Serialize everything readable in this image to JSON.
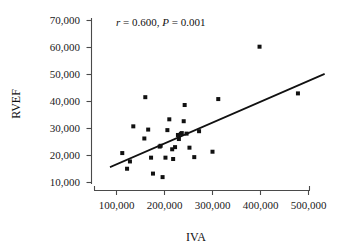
{
  "chart_data": {
    "type": "scatter",
    "title": "",
    "subtitle": "",
    "xlabel": "IVA",
    "ylabel": "RVEF",
    "xlim": [
      80000,
      530000
    ],
    "ylim": [
      8000,
      72000
    ],
    "xticks": [
      100000,
      200000,
      300000,
      400000,
      500000
    ],
    "xtick_labels": [
      "100,000",
      "200,000",
      "300,000",
      "400,000",
      "500,000"
    ],
    "yticks": [
      10000,
      20000,
      30000,
      40000,
      50000,
      60000,
      70000
    ],
    "ytick_labels": [
      "10,000",
      "20,000",
      "30,000",
      "40,000",
      "50,000",
      "60,000",
      "70,000"
    ],
    "grid": false,
    "legend": null,
    "annotations": [
      {
        "name": "correlation-statistics",
        "text": "r = 0.600, P = 0.001",
        "r_symbol": "r",
        "r_value": "= 0.600,",
        "p_symbol": "P",
        "p_value": "= 0.001",
        "x": 250000,
        "y": 69000
      }
    ],
    "marker": {
      "shape": "square",
      "color": "#111111",
      "size": 2.6
    },
    "series": [
      {
        "name": "observations",
        "points": [
          [
            112000,
            20900
          ],
          [
            122000,
            15100
          ],
          [
            128000,
            17800
          ],
          [
            135000,
            30800
          ],
          [
            160000,
            41600
          ],
          [
            158000,
            26300
          ],
          [
            166000,
            29600
          ],
          [
            172000,
            19200
          ],
          [
            176000,
            13300
          ],
          [
            192000,
            23600
          ],
          [
            190000,
            23300
          ],
          [
            196000,
            12000
          ],
          [
            202000,
            19200
          ],
          [
            206000,
            29400
          ],
          [
            210000,
            33400
          ],
          [
            216000,
            22300
          ],
          [
            218000,
            18700
          ],
          [
            222000,
            23100
          ],
          [
            228000,
            27600
          ],
          [
            230000,
            26100
          ],
          [
            234000,
            28000
          ],
          [
            236000,
            28300
          ],
          [
            240000,
            32700
          ],
          [
            242000,
            38700
          ],
          [
            246000,
            28100
          ],
          [
            252000,
            22900
          ],
          [
            262000,
            19400
          ],
          [
            272000,
            29000
          ],
          [
            300000,
            21400
          ],
          [
            312000,
            40900
          ],
          [
            398000,
            60300
          ],
          [
            478000,
            43000
          ]
        ]
      }
    ],
    "fit_line": {
      "name": "regression-line",
      "x_start": 88000,
      "y_start": 15800,
      "x_end": 532000,
      "y_end": 50100,
      "color": "#111111"
    }
  }
}
